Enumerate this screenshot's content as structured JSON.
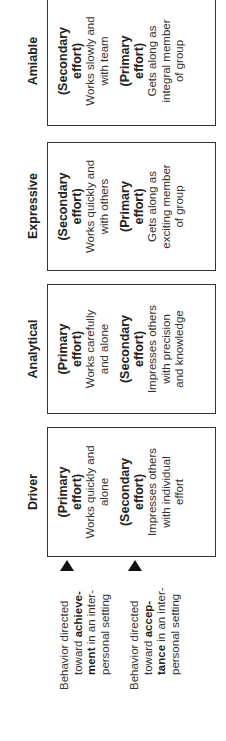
{
  "columns": [
    {
      "header": "Driver",
      "first": {
        "label_1": "(Primary",
        "label_2": "effort)",
        "desc_1": "Works quickly and",
        "desc_2": "alone"
      },
      "second": {
        "label_1": "(Secondary",
        "label_2": "effort)",
        "desc_1": "Impresses others",
        "desc_2": "with individual",
        "desc_3": "effort"
      }
    },
    {
      "header": "Analytical",
      "first": {
        "label_1": "(Primary",
        "label_2": "effort)",
        "desc_1": "Works carefully",
        "desc_2": "and alone"
      },
      "second": {
        "label_1": "(Secondary",
        "label_2": "effort)",
        "desc_1": "Impresses others",
        "desc_2": "with precision",
        "desc_3": "and knowledge"
      }
    },
    {
      "header": "Expressive",
      "first": {
        "label_1": "(Secondary",
        "label_2": "effort)",
        "desc_1": "Works quickly and",
        "desc_2": "with others"
      },
      "second": {
        "label_1": "(Primary",
        "label_2": "effort)",
        "desc_1": "Gets along as",
        "desc_2": "exciting member",
        "desc_3": "of group"
      }
    },
    {
      "header": "Amiable",
      "first": {
        "label_1": "(Secondary",
        "label_2": "effort)",
        "desc_1": "Works slowly and",
        "desc_2": "with team"
      },
      "second": {
        "label_1": "(Primary",
        "label_2": "effort)",
        "desc_1": "Gets along as",
        "desc_2": "integral member",
        "desc_3": "of group"
      }
    }
  ],
  "row_labels": [
    {
      "line_1": "Behavior directed",
      "line_2_pre": "toward ",
      "line_2_bold": "achieve-",
      "line_3_bold": "ment",
      "line_3_post": " in an inter-",
      "line_4": "personal setting"
    },
    {
      "line_1": "Behavior directed",
      "line_2_pre": "toward ",
      "line_2_bold": "accep-",
      "line_3_bold": "tance",
      "line_3_post": " in an inter-",
      "line_4": "personal setting"
    }
  ],
  "icons": {
    "row_marker": "triangle-marker"
  }
}
